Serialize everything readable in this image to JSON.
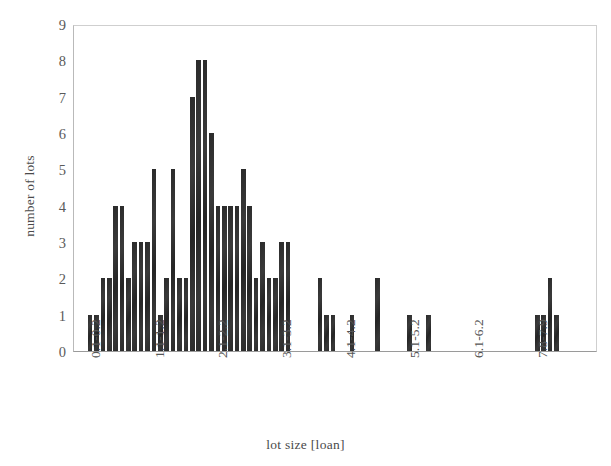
{
  "chart_data": {
    "type": "bar",
    "title": "",
    "xlabel": "lot size [loan]",
    "ylabel": "number of lots",
    "ylim": [
      0,
      9
    ],
    "ytick_labels": [
      "0",
      "1",
      "2",
      "3",
      "4",
      "5",
      "6",
      "7",
      "8",
      "9"
    ],
    "ytick_values": [
      0,
      1,
      2,
      3,
      4,
      5,
      6,
      7,
      8,
      9
    ],
    "xtick_labels": [
      "0.1-0.2",
      "1.1-1.2",
      "2.1-2.2",
      "3.1-3.2",
      "4.1-4.2",
      "5.1-5.2",
      "6.1-6.2",
      "7.8-7.9"
    ],
    "xtick_bin_index": [
      0,
      10,
      20,
      30,
      40,
      50,
      60,
      70
    ],
    "grid": false,
    "legend": null,
    "bar_color": "#303030",
    "bin_width": 0.1,
    "bin_start": 0.1,
    "categories": [
      "0.1-0.2",
      "0.2-0.3",
      "0.3-0.4",
      "0.4-0.5",
      "0.5-0.6",
      "0.6-0.7",
      "0.7-0.8",
      "0.8-0.9",
      "0.9-1.0",
      "1.0-1.1",
      "1.1-1.2",
      "1.2-1.3",
      "1.3-1.4",
      "1.4-1.5",
      "1.5-1.6",
      "1.6-1.7",
      "1.7-1.8",
      "1.8-1.9",
      "1.9-2.0",
      "2.0-2.1",
      "2.1-2.2",
      "2.2-2.3",
      "2.3-2.4",
      "2.4-2.5",
      "2.5-2.6",
      "2.6-2.7",
      "2.7-2.8",
      "2.8-2.9",
      "2.9-3.0",
      "3.0-3.1",
      "3.1-3.2",
      "3.2-3.3",
      "3.3-3.4",
      "3.4-3.5",
      "3.5-3.6",
      "3.6-3.7",
      "3.7-3.8",
      "3.8-3.9",
      "3.9-4.0",
      "4.0-4.1",
      "4.1-4.2",
      "4.2-4.3",
      "4.3-4.4",
      "4.4-4.5",
      "4.5-4.6",
      "4.6-4.7",
      "4.7-4.8",
      "4.8-4.9",
      "4.9-5.0",
      "5.0-5.1",
      "5.1-5.2",
      "5.2-5.3",
      "5.3-5.4",
      "5.4-5.5",
      "5.5-5.6",
      "5.6-5.7",
      "5.7-5.8",
      "5.8-5.9",
      "5.9-6.0",
      "6.0-6.1",
      "6.1-6.2",
      "6.2-6.3",
      "6.3-6.4",
      "6.4-6.5",
      "6.5-6.6",
      "6.6-6.7",
      "6.7-6.8",
      "6.8-6.9",
      "6.9-7.0",
      "7.0-7.1",
      "7.1-7.2",
      "7.2-7.3",
      "7.3-7.4",
      "7.4-7.5",
      "7.5-7.6",
      "7.6-7.7",
      "7.7-7.8",
      "7.8-7.9"
    ],
    "values": [
      0,
      1,
      1,
      2,
      2,
      4,
      4,
      2,
      3,
      3,
      3,
      5,
      1,
      2,
      5,
      2,
      2,
      7,
      8,
      8,
      6,
      4,
      4,
      4,
      4,
      5,
      4,
      2,
      3,
      2,
      2,
      3,
      3,
      0,
      0,
      0,
      0,
      2,
      1,
      1,
      0,
      0,
      1,
      0,
      0,
      0,
      2,
      0,
      0,
      0,
      0,
      1,
      0,
      0,
      1,
      0,
      0,
      0,
      0,
      0,
      0,
      0,
      0,
      0,
      0,
      0,
      0,
      0,
      0,
      0,
      0,
      1,
      1,
      2,
      1,
      0,
      0,
      0
    ]
  }
}
